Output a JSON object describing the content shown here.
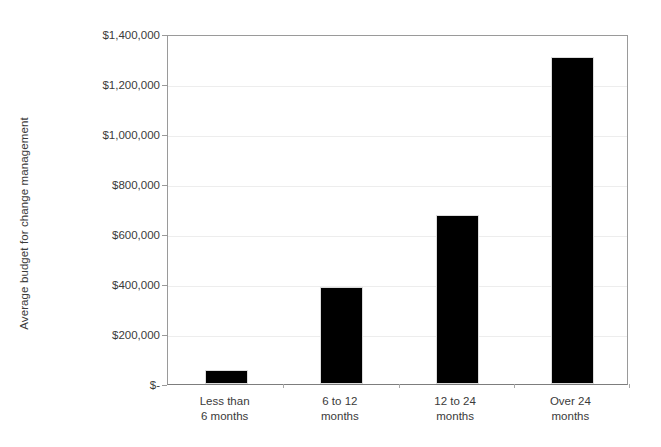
{
  "chart_data": {
    "type": "bar",
    "title": "",
    "subtitle": "",
    "xlabel": "",
    "ylabel": "Average budget for change management",
    "categories": [
      "Less than 6 months",
      "6 to 12 months",
      "12 to 24 months",
      "Over 24 months"
    ],
    "category_lines": [
      [
        "Less than",
        "6 months"
      ],
      [
        "6 to 12",
        "months"
      ],
      [
        "12 to 24",
        "months"
      ],
      [
        "Over 24",
        "months"
      ]
    ],
    "values": [
      50000,
      380000,
      670000,
      1300000
    ],
    "ylim": [
      0,
      1400000
    ],
    "ytick_values": [
      0,
      200000,
      400000,
      600000,
      800000,
      1000000,
      1200000,
      1400000
    ],
    "ytick_labels": [
      "$-",
      "$200,000",
      "$400,000",
      "$600,000",
      "$800,000",
      "$1,000,000",
      "$1,200,000",
      "$1,400,000"
    ],
    "grid": true,
    "legend": false,
    "legend_position": "none",
    "bar_color": "#000000",
    "axis_color": "#9a9a9a",
    "grid_color": "#ededed",
    "background_color": "#ffffff"
  },
  "axis": {
    "y_title": "Average budget for change management"
  }
}
